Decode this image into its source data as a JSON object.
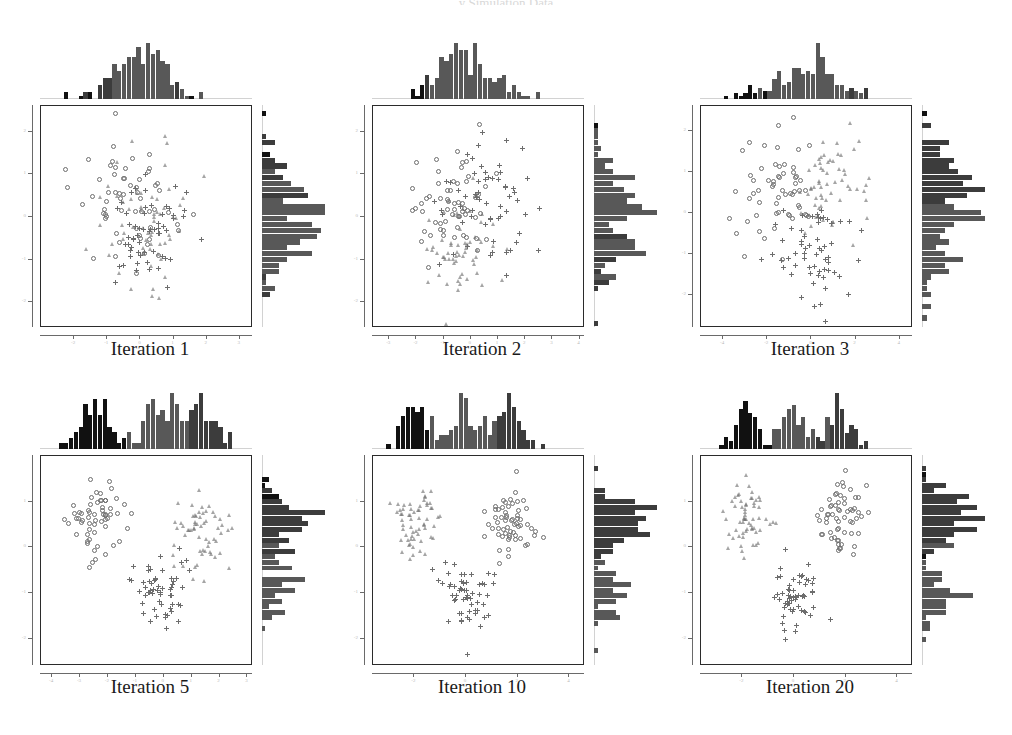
{
  "figure": {
    "title": "y Simulation Data",
    "corner_label": "",
    "caption_prefix": "Iteration"
  },
  "panels": [
    {
      "id": "iteration-1",
      "caption": "Iteration 1",
      "xticks": [
        "-2",
        "-1",
        "0",
        "1",
        "2",
        "3"
      ],
      "yticks": [
        "2",
        "1",
        "0",
        "-1",
        "-2"
      ],
      "xlim": [
        -3.0,
        3.4
      ],
      "ylim": [
        -2.6,
        2.6
      ],
      "state": "mixed"
    },
    {
      "id": "iteration-2",
      "caption": "Iteration 2",
      "xticks": [
        "-3",
        "-2",
        "-1",
        "0",
        "1",
        "2",
        "3",
        "4"
      ],
      "yticks": [
        "2",
        "1",
        "0",
        "-1",
        "-2"
      ],
      "xlim": [
        -3.6,
        4.2
      ],
      "ylim": [
        -2.6,
        2.6
      ],
      "state": "mixed"
    },
    {
      "id": "iteration-3",
      "caption": "Iteration 3",
      "xticks": [
        "-4",
        "-2",
        "0",
        "2",
        "4"
      ],
      "yticks": [
        "2",
        "1",
        "0",
        "-1",
        "-2"
      ],
      "xlim": [
        -5.0,
        4.6
      ],
      "ylim": [
        -2.8,
        2.6
      ],
      "state": "partial"
    },
    {
      "id": "iteration-5",
      "caption": "Iteration 5",
      "xticks": [
        "-4",
        "-3",
        "-2",
        "-1",
        "0",
        "1",
        "2",
        "3"
      ],
      "yticks": [
        "1",
        "0",
        "-1",
        "-2"
      ],
      "xlim": [
        -4.4,
        3.2
      ],
      "ylim": [
        -2.6,
        2.0
      ],
      "state": "separated"
    },
    {
      "id": "iteration-10",
      "caption": "Iteration 10",
      "xticks": [
        "-2",
        "0",
        "2",
        "4"
      ],
      "yticks": [
        "1",
        "0",
        "-1",
        "-2"
      ],
      "xlim": [
        -3.6,
        4.6
      ],
      "ylim": [
        -2.6,
        2.0
      ],
      "state": "separated"
    },
    {
      "id": "iteration-20",
      "caption": "Iteration 20",
      "xticks": [
        "-2",
        "0",
        "2",
        "4"
      ],
      "yticks": [
        "1",
        "0",
        "-1",
        "-2"
      ],
      "xlim": [
        -3.6,
        4.6
      ],
      "ylim": [
        -2.6,
        2.0
      ],
      "state": "separated"
    }
  ],
  "markers": {
    "component_1": "circle",
    "component_2": "triangle",
    "component_3": "plus"
  },
  "colors": {
    "marker": "#6d6d6d",
    "hist_dark": "#111111",
    "hist_mid": "#3c3c3c",
    "hist_light": "#585858",
    "axis": "#6a6a6a",
    "box": "#2b2b2b",
    "caption": "#1a1a1a"
  },
  "chart_data": {
    "type": "scatter",
    "title": "y Simulation Data",
    "xlabel": "",
    "ylabel": "",
    "grid": false,
    "legend": "none",
    "panels": [
      {
        "name": "Iteration 1",
        "xlim": [
          -3.0,
          3.4
        ],
        "ylim": [
          -2.6,
          2.6
        ],
        "xticks": [
          -2,
          -1,
          0,
          1,
          2,
          3
        ],
        "yticks": [
          -2,
          -1,
          0,
          1,
          2
        ],
        "n_points": 180,
        "clusters": [
          {
            "marker": "circle",
            "cx": -0.35,
            "cy": 0.25,
            "sx": 0.75,
            "sy": 0.72,
            "n": 60
          },
          {
            "marker": "triangle",
            "cx": 0.15,
            "cy": 0.1,
            "sx": 0.8,
            "sy": 0.78,
            "n": 60
          },
          {
            "marker": "plus",
            "cx": 0.25,
            "cy": -0.35,
            "sx": 0.78,
            "sy": 0.7,
            "n": 60
          }
        ],
        "top_hist_peak": 14,
        "right_hist_peak": 16
      },
      {
        "name": "Iteration 2",
        "xlim": [
          -3.6,
          4.2
        ],
        "ylim": [
          -2.6,
          2.6
        ],
        "xticks": [
          -3,
          -2,
          -1,
          0,
          1,
          2,
          3,
          4
        ],
        "yticks": [
          -2,
          -1,
          0,
          1,
          2
        ],
        "n_points": 180,
        "clusters": [
          {
            "marker": "circle",
            "cx": -0.75,
            "cy": 0.35,
            "sx": 0.72,
            "sy": 0.7,
            "n": 60
          },
          {
            "marker": "triangle",
            "cx": -0.3,
            "cy": -0.7,
            "sx": 0.7,
            "sy": 0.65,
            "n": 60
          },
          {
            "marker": "plus",
            "cx": 0.65,
            "cy": 0.25,
            "sx": 0.85,
            "sy": 0.72,
            "n": 60
          }
        ],
        "top_hist_peak": 13,
        "right_hist_peak": 15
      },
      {
        "name": "Iteration 3",
        "xlim": [
          -5.0,
          4.6
        ],
        "ylim": [
          -2.8,
          2.6
        ],
        "xticks": [
          -4,
          -2,
          0,
          2,
          4
        ],
        "yticks": [
          -2,
          -1,
          0,
          1,
          2
        ],
        "n_points": 180,
        "clusters": [
          {
            "marker": "circle",
            "cx": -1.6,
            "cy": 0.45,
            "sx": 0.85,
            "sy": 0.7,
            "n": 60
          },
          {
            "marker": "triangle",
            "cx": 0.9,
            "cy": 0.7,
            "sx": 0.9,
            "sy": 0.6,
            "n": 60
          },
          {
            "marker": "plus",
            "cx": 0.1,
            "cy": -1.05,
            "sx": 0.95,
            "sy": 0.6,
            "n": 60
          }
        ],
        "top_hist_peak": 12,
        "right_hist_peak": 15
      },
      {
        "name": "Iteration 5",
        "xlim": [
          -4.4,
          3.2
        ],
        "ylim": [
          -2.6,
          2.0
        ],
        "xticks": [
          -4,
          -3,
          -2,
          -1,
          0,
          1,
          2,
          3
        ],
        "yticks": [
          -2,
          -1,
          0,
          1
        ],
        "n_points": 180,
        "clusters": [
          {
            "marker": "circle",
            "cx": -2.4,
            "cy": 0.6,
            "sx": 0.55,
            "sy": 0.45,
            "n": 60
          },
          {
            "marker": "triangle",
            "cx": 1.45,
            "cy": 0.3,
            "sx": 0.5,
            "sy": 0.42,
            "n": 60
          },
          {
            "marker": "plus",
            "cx": -0.15,
            "cy": -1.05,
            "sx": 0.55,
            "sy": 0.4,
            "n": 60
          }
        ],
        "top_hist_peak": 12,
        "right_hist_peak": 17
      },
      {
        "name": "Iteration 10",
        "xlim": [
          -3.6,
          4.6
        ],
        "ylim": [
          -2.6,
          2.0
        ],
        "xticks": [
          -2,
          0,
          2,
          4
        ],
        "yticks": [
          -2,
          -1,
          0,
          1
        ],
        "n_points": 180,
        "clusters": [
          {
            "marker": "triangle",
            "cx": -1.9,
            "cy": 0.55,
            "sx": 0.45,
            "sy": 0.4,
            "n": 60
          },
          {
            "marker": "circle",
            "cx": 1.7,
            "cy": 0.6,
            "sx": 0.5,
            "sy": 0.42,
            "n": 60
          },
          {
            "marker": "plus",
            "cx": 0.05,
            "cy": -1.1,
            "sx": 0.5,
            "sy": 0.4,
            "n": 60
          }
        ],
        "top_hist_peak": 13,
        "right_hist_peak": 17
      },
      {
        "name": "Iteration 20",
        "xlim": [
          -3.6,
          4.6
        ],
        "ylim": [
          -2.6,
          2.0
        ],
        "xticks": [
          -2,
          0,
          2,
          4
        ],
        "yticks": [
          -2,
          -1,
          0,
          1
        ],
        "n_points": 180,
        "clusters": [
          {
            "marker": "triangle",
            "cx": -1.9,
            "cy": 0.55,
            "sx": 0.42,
            "sy": 0.38,
            "n": 60
          },
          {
            "marker": "circle",
            "cx": 1.75,
            "cy": 0.65,
            "sx": 0.48,
            "sy": 0.4,
            "n": 60
          },
          {
            "marker": "plus",
            "cx": 0.05,
            "cy": -1.1,
            "sx": 0.48,
            "sy": 0.38,
            "n": 60
          }
        ],
        "top_hist_peak": 13,
        "right_hist_peak": 17
      }
    ]
  }
}
